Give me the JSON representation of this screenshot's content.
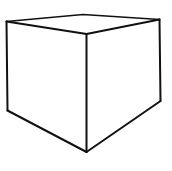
{
  "figure": {
    "stroke_color": "#111111",
    "background": "#ffffff",
    "vertices": {
      "top_left": [
        6.5,
        21.5
      ],
      "top_back": [
        83,
        14.5
      ],
      "top_right": [
        159.5,
        19.5
      ],
      "front_top": [
        86.5,
        34
      ],
      "bottom_left": [
        7.5,
        110.5
      ],
      "front_bottom": [
        86.5,
        152
      ],
      "bottom_right": [
        160.5,
        101
      ]
    }
  }
}
